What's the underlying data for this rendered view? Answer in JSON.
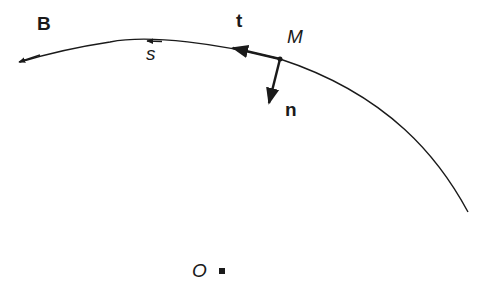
{
  "diagram": {
    "labels": {
      "origin": "B",
      "arc_coordinate": "s",
      "tangent": "t",
      "point": "M",
      "normal": "n",
      "center": "O"
    },
    "colors": {
      "stroke": "#1a1a1a",
      "background": "#ffffff"
    }
  }
}
